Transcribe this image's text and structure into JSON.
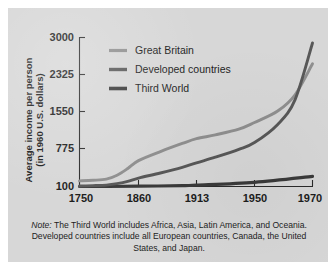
{
  "figure": {
    "background_color": "#d7d7d7",
    "page_background": "#ffffff"
  },
  "chart_data": {
    "type": "line",
    "title": "",
    "xlabel": "",
    "ylabel": "Average income per person (in 1960 U.S. dollars)",
    "ylabel_line1": "Average income per person",
    "ylabel_line2": "(in 1960 U.S. dollars)",
    "x_tick_labels": [
      "1750",
      "1860",
      "1913",
      "1950",
      "1970"
    ],
    "x_tick_values": [
      1750,
      1860,
      1913,
      1950,
      1970
    ],
    "y_tick_labels": [
      "100",
      "775",
      "1550",
      "2325",
      "3000"
    ],
    "y_tick_values": [
      100,
      775,
      1550,
      2325,
      3000
    ],
    "ylim": [
      100,
      3000
    ],
    "grid": false,
    "legend_position": "upper-left-inside",
    "series": [
      {
        "name": "Great Britain",
        "color": "#8f8f8f",
        "x": [
          1750,
          1775,
          1800,
          1820,
          1840,
          1860,
          1880,
          1900,
          1913,
          1925,
          1940,
          1950,
          1958,
          1964,
          1970
        ],
        "values": [
          200,
          210,
          230,
          300,
          420,
          560,
          720,
          880,
          980,
          1060,
          1180,
          1320,
          1560,
          1900,
          2520
        ]
      },
      {
        "name": "Developed countries",
        "color": "#585858",
        "x": [
          1750,
          1775,
          1800,
          1820,
          1840,
          1860,
          1880,
          1900,
          1913,
          1925,
          1940,
          1950,
          1958,
          1964,
          1970
        ],
        "values": [
          110,
          115,
          125,
          150,
          190,
          250,
          340,
          440,
          520,
          620,
          760,
          900,
          1280,
          1800,
          2900
        ]
      },
      {
        "name": "Third World",
        "color": "#3a3a3a",
        "x": [
          1750,
          1800,
          1860,
          1900,
          1913,
          1950,
          1970
        ],
        "values": [
          100,
          100,
          105,
          115,
          125,
          175,
          280
        ]
      }
    ]
  },
  "legend": {
    "items": [
      {
        "label": "Great Britain",
        "color": "#8f8f8f"
      },
      {
        "label": "Developed countries",
        "color": "#585858"
      },
      {
        "label": "Third World",
        "color": "#3a3a3a"
      }
    ]
  },
  "note": {
    "prefix": "Note:",
    "text": "The Third World includes Africa, Asia, Latin America, and Oceania. Developed countries include all European countries, Canada, the United States, and Japan."
  }
}
